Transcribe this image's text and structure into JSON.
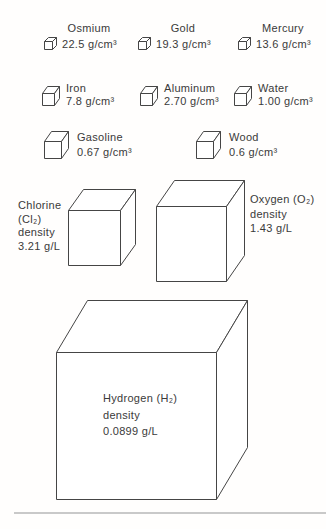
{
  "colors": {
    "background": "#ffffff",
    "line": "#454545",
    "text": "#3a3a3a",
    "bottom_rule": "#c9c9c9"
  },
  "figure": {
    "solids_row1": [
      {
        "name": "Osmium",
        "value": "22.5 g/cm³"
      },
      {
        "name": "Gold",
        "value": "19.3 g/cm³"
      },
      {
        "name": "Mercury",
        "value": "13.6 g/cm³"
      }
    ],
    "solids_row2": [
      {
        "name": "Iron",
        "value": "7.8 g/cm³"
      },
      {
        "name": "Aluminum",
        "value": "2.70 g/cm³"
      },
      {
        "name": "Water",
        "value": "1.00 g/cm³"
      }
    ],
    "solids_row3": [
      {
        "name": "Gasoline",
        "value": "0.67 g/cm³"
      },
      {
        "name": "Wood",
        "value": "0.6 g/cm³"
      }
    ],
    "gases": {
      "chlorine": {
        "lines": [
          "Chlorine",
          "(Cl₂)",
          "density",
          "3.21 g/L"
        ]
      },
      "oxygen": {
        "lines": [
          "Oxygen (O₂)",
          "density",
          "1.43 g/L"
        ]
      },
      "hydrogen": {
        "lines": [
          "Hydrogen (H₂)",
          "density",
          "0.0899 g/L"
        ]
      }
    }
  }
}
